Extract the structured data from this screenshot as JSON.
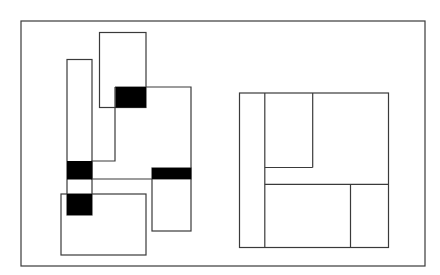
{
  "figure": {
    "width": 440,
    "height": 275,
    "background": "#ffffff",
    "stroke_color": "#3a3a3a",
    "fill_color": "#000000",
    "stroke_width": 1.2,
    "frame": {
      "x": 21,
      "y": 21,
      "w": 404,
      "h": 245
    }
  },
  "left_diagram": {
    "outline_rects": [
      {
        "id": "tall-left",
        "x": 67,
        "y": 59.5,
        "w": 25,
        "h": 155.5
      },
      {
        "id": "top",
        "x": 99.5,
        "y": 32.5,
        "w": 46.5,
        "h": 75
      },
      {
        "id": "bottom-left",
        "x": 61,
        "y": 194,
        "w": 85,
        "h": 61
      },
      {
        "id": "right-tall",
        "x": 152,
        "y": 168,
        "w": 39,
        "h": 63
      }
    ],
    "outline_polygons": [
      {
        "id": "center-region",
        "points": "115,87 191,87 191,179 92,179 92,161 115,161 115,87"
      }
    ],
    "filled_rects": [
      {
        "id": "black-top",
        "x": 115.5,
        "y": 87,
        "w": 30.5,
        "h": 20.5
      },
      {
        "id": "black-mid-left",
        "x": 67,
        "y": 161,
        "w": 25,
        "h": 18.5
      },
      {
        "id": "black-bar-right",
        "x": 152,
        "y": 168,
        "w": 39,
        "h": 11
      },
      {
        "id": "black-bottom-left",
        "x": 67,
        "y": 194,
        "w": 25,
        "h": 21
      }
    ]
  },
  "right_diagram": {
    "outer": {
      "x": 239.5,
      "y": 93,
      "w": 149,
      "h": 154.5
    },
    "lines": [
      {
        "id": "vertical-left-divider",
        "x1": 264.8,
        "y1": 93,
        "x2": 264.8,
        "y2": 247.5
      },
      {
        "id": "inner-rect-right",
        "x1": 312.7,
        "y1": 93,
        "x2": 312.7,
        "y2": 167.5
      },
      {
        "id": "inner-rect-bottom",
        "x1": 264.8,
        "y1": 167.5,
        "x2": 312.7,
        "y2": 167.5
      },
      {
        "id": "horizontal-divider",
        "x1": 264.8,
        "y1": 184.3,
        "x2": 388.5,
        "y2": 184.3
      },
      {
        "id": "vertical-bottom-divider",
        "x1": 350.5,
        "y1": 184.3,
        "x2": 350.5,
        "y2": 247.5
      }
    ]
  }
}
